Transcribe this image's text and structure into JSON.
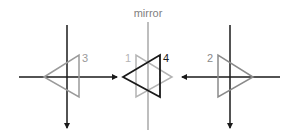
{
  "title": "mirror",
  "labels": {
    "t1": "1",
    "t2": "2",
    "t3": "3",
    "t4": "4"
  },
  "colors": {
    "dark": "#1a1a1a",
    "gray": "#9a9a9a",
    "mirror": "#a8a8a8",
    "text": "#808080"
  }
}
